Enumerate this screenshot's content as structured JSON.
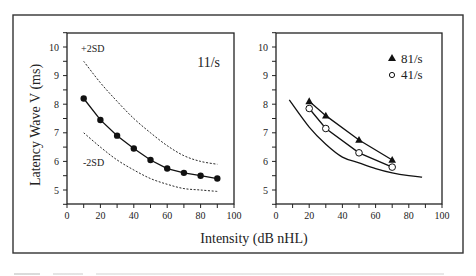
{
  "chart_data": [
    {
      "type": "line",
      "panel": "left",
      "title": "",
      "annotation": "11/s",
      "xlabel": "Intensity (dB nHL)",
      "ylabel": "Latency Wave V (ms)",
      "xlim": [
        0,
        100
      ],
      "ylim": [
        4.5,
        10.5
      ],
      "xticks": [
        0,
        20,
        40,
        60,
        80,
        100
      ],
      "yticks": [
        5,
        6,
        7,
        8,
        9,
        10
      ],
      "grid": false,
      "series": [
        {
          "name": "Mean latency (11/s)",
          "style": "solid-filled-circle",
          "x": [
            10,
            20,
            30,
            40,
            50,
            60,
            70,
            80,
            90
          ],
          "values": [
            8.2,
            7.45,
            6.9,
            6.45,
            6.05,
            5.75,
            5.6,
            5.5,
            5.4
          ]
        },
        {
          "name": "+2SD",
          "style": "dashed",
          "x": [
            10,
            20,
            30,
            40,
            50,
            60,
            70,
            80,
            90
          ],
          "values": [
            9.5,
            8.75,
            8.1,
            7.5,
            7.0,
            6.55,
            6.2,
            6.0,
            5.9
          ]
        },
        {
          "name": "-2SD",
          "style": "dashed",
          "x": [
            10,
            20,
            30,
            40,
            50,
            60,
            70,
            80,
            90
          ],
          "values": [
            7.0,
            6.5,
            6.05,
            5.7,
            5.4,
            5.2,
            5.05,
            5.0,
            4.95
          ]
        }
      ],
      "labels": [
        {
          "text": "+2SD",
          "x": 10,
          "y": 9.9
        },
        {
          "text": "-2SD",
          "x": 10,
          "y": 6.1
        }
      ]
    },
    {
      "type": "line",
      "panel": "right",
      "title": "",
      "xlabel": "Intensity (dB nHL)",
      "ylabel": "",
      "xlim": [
        0,
        100
      ],
      "ylim": [
        4.5,
        10.5
      ],
      "xticks": [
        0,
        20,
        40,
        60,
        80,
        100
      ],
      "yticks": [
        5,
        6,
        7,
        8,
        9,
        10
      ],
      "grid": false,
      "legend_position": "upper right",
      "series": [
        {
          "name": "81/s",
          "style": "solid-filled-triangle",
          "x": [
            20,
            30,
            50,
            70
          ],
          "values": [
            8.1,
            7.6,
            6.75,
            6.05
          ]
        },
        {
          "name": "41/s",
          "style": "solid-open-circle",
          "x": [
            20,
            30,
            50,
            70
          ],
          "values": [
            7.85,
            7.15,
            6.3,
            5.8
          ]
        },
        {
          "name": "11/s mean (reference)",
          "style": "solid-line",
          "x": [
            8,
            20,
            30,
            40,
            50,
            60,
            70,
            80,
            88
          ],
          "values": [
            8.15,
            7.2,
            6.6,
            6.15,
            5.95,
            5.75,
            5.6,
            5.5,
            5.45
          ]
        }
      ]
    }
  ],
  "figure": {
    "xlabel_shared": "Intensity (dB nHL)",
    "ylabel": "Latency Wave V (ms)",
    "left_annotation": "11/s",
    "upper_sd_label": "+2SD",
    "lower_sd_label": "-2SD",
    "legend": [
      {
        "symbol": "triangle-filled",
        "label": "81/s"
      },
      {
        "symbol": "circle-open",
        "label": "41/s"
      }
    ]
  }
}
